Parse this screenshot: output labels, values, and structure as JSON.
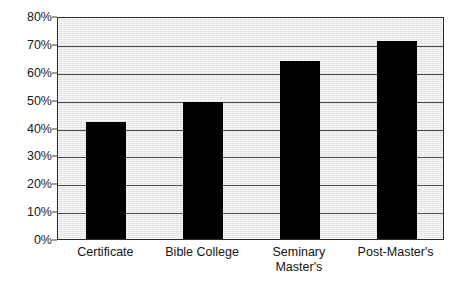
{
  "chart_data": {
    "type": "bar",
    "title": "",
    "xlabel": "",
    "ylabel": "",
    "categories": [
      "Certificate",
      "Bible College",
      "Seminary Master's",
      "Post-Master's"
    ],
    "category_labels_wrapped": [
      "Certificate",
      "Bible College",
      "Seminary\nMaster's",
      "Post-Master's"
    ],
    "values": [
      42,
      49,
      64,
      71
    ],
    "value_labels": [
      "42%",
      "49%",
      "64%",
      "71%"
    ],
    "ylim": [
      0,
      80
    ],
    "ytick_values": [
      80,
      70,
      60,
      50,
      40,
      30,
      20,
      10,
      0
    ],
    "ytick_labels": [
      "80%",
      "70%",
      "60%",
      "50%",
      "40%",
      "30%",
      "20%",
      "10%",
      "0%"
    ],
    "grid": true,
    "grid_axis": "y",
    "legend": false,
    "legend_position": "none",
    "bar_color": "#000000",
    "plot_background_color": "#ededed",
    "page_background_color": "#ffffff",
    "axis_color": "#2b2b2b",
    "gridline_color": "#4a4a4a",
    "text_color": "#141414"
  }
}
